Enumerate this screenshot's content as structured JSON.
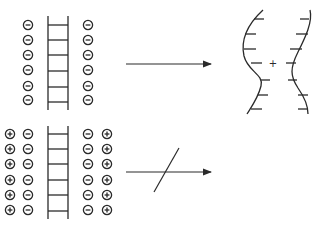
{
  "diagram": {
    "colors": {
      "stroke": "#2a2a2a",
      "background": "#ffffff"
    },
    "top_panel": {
      "left_charges": [
        "-",
        "-",
        "-",
        "-",
        "-",
        "-"
      ],
      "right_charges": [
        "-",
        "-",
        "-",
        "-",
        "-",
        "-"
      ],
      "ladder_rungs": 6,
      "arrow": {
        "type": "allowed",
        "label": ""
      },
      "result": {
        "shape": "two bowed strands curving apart",
        "center_symbol": "+",
        "left_strand_ticks": 8,
        "right_strand_ticks": 8
      }
    },
    "bottom_panel": {
      "left_outer_charges": [
        "+",
        "+",
        "+",
        "+",
        "+",
        "+"
      ],
      "left_inner_charges": [
        "-",
        "-",
        "-",
        "-",
        "-",
        "-"
      ],
      "right_inner_charges": [
        "-",
        "-",
        "-",
        "-",
        "-",
        "-"
      ],
      "right_outer_charges": [
        "+",
        "+",
        "+",
        "+",
        "+",
        "+"
      ],
      "ladder_rungs": 6,
      "arrow": {
        "type": "blocked",
        "label": "",
        "strike": "/"
      }
    },
    "center_plus_label": "+"
  }
}
